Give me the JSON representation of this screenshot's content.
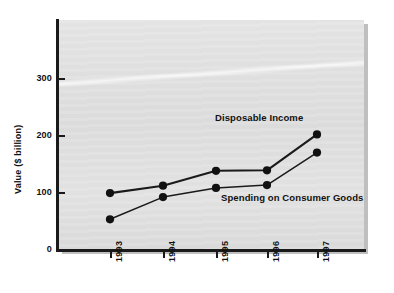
{
  "chart_data": {
    "type": "line",
    "title": "",
    "xlabel": "",
    "ylabel": "Value ($ billion)",
    "categories": [
      "1993",
      "1994",
      "1995",
      "1996",
      "1997"
    ],
    "ylim": [
      0,
      380
    ],
    "yticks": [
      0,
      100,
      200,
      300
    ],
    "ytick_labels": [
      "0",
      "100",
      "200",
      "300"
    ],
    "grid": false,
    "legend": "inline-annotations",
    "series": [
      {
        "name": "Disposable Income",
        "values": [
          99,
          112,
          138,
          139,
          202
        ],
        "color": "#1a1a1a",
        "marker": "filled-circle"
      },
      {
        "name": "Spending on Consumer Goods",
        "values": [
          53,
          92,
          108,
          113,
          170
        ],
        "color": "#1a1a1a",
        "marker": "filled-circle"
      }
    ],
    "annotations": [
      {
        "text": "Disposable Income",
        "series": "Disposable Income"
      },
      {
        "text": "Spending on Consumer Goods",
        "series": "Spending on Consumer Goods"
      }
    ]
  },
  "axes": {
    "y_title": "Value ($ billion)",
    "y_tick_labels": [
      "300",
      "200",
      "100",
      "0"
    ],
    "x_tick_labels": [
      "1993",
      "1994",
      "1995",
      "1996",
      "1997"
    ]
  },
  "labels": {
    "disposable_income": "Disposable Income",
    "spending_on_consumer_goods": "Spending on Consumer Goods"
  },
  "colors": {
    "plot_background": "#e2e2e2",
    "axis": "#1a1a1a",
    "series_line": "#1a1a1a",
    "marker": "#111111",
    "page_background": "#ffffff",
    "shadow": "#bfbfbf"
  }
}
